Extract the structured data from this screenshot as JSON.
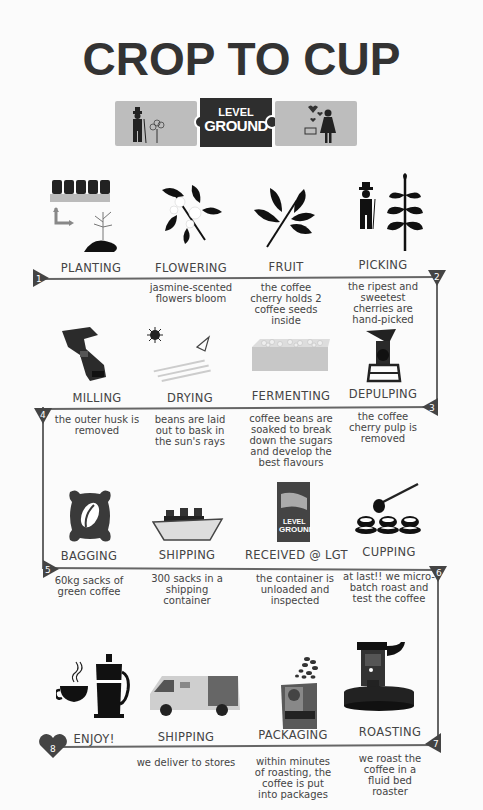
{
  "title": "CROP TO CUP",
  "logo": {
    "line1": "LEVEL",
    "line2": "GROUND"
  },
  "colors": {
    "text": "#333333",
    "line": "#666666",
    "marker": "#444444",
    "logo_side": "#bdbdbd",
    "logo_center": "#2e2e2e"
  },
  "rows": [
    {
      "steps": [
        {
          "label": "PLANTING",
          "desc": "",
          "icon": "seedling-tray-icon"
        },
        {
          "label": "FLOWERING",
          "desc": "jasmine-scented flowers bloom",
          "icon": "flower-branch-icon"
        },
        {
          "label": "FRUIT",
          "desc": "the coffee cherry holds 2 coffee seeds inside",
          "icon": "coffee-branch-icon"
        },
        {
          "label": "PICKING",
          "desc": "the ripest and sweetest cherries are hand-picked",
          "icon": "farmer-with-plant-icon"
        }
      ]
    },
    {
      "steps": [
        {
          "label": "MILLING",
          "desc": "the outer husk is removed",
          "icon": "milling-machine-icon"
        },
        {
          "label": "DRYING",
          "desc": "beans are laid out to bask in the sun's rays",
          "icon": "sun-drying-icon"
        },
        {
          "label": "FERMENTING",
          "desc": "coffee beans are soaked to break down the sugars and develop the best flavours",
          "icon": "fermenting-tank-icon"
        },
        {
          "label": "DEPULPING",
          "desc": "the coffee cherry pulp is removed",
          "icon": "depulper-machine-icon"
        }
      ]
    },
    {
      "steps": [
        {
          "label": "BAGGING",
          "desc": "60kg sacks of green coffee",
          "icon": "coffee-sack-icon"
        },
        {
          "label": "SHIPPING",
          "desc": "300 sacks in a shipping container",
          "icon": "cargo-ship-icon"
        },
        {
          "label": "RECEIVED @ LGT",
          "desc": "the container is unloaded and inspected",
          "icon": "level-ground-bag-icon"
        },
        {
          "label": "CUPPING",
          "desc": "at last!! we micro-batch roast and test the coffee",
          "icon": "cupping-spoon-icon"
        }
      ]
    },
    {
      "steps": [
        {
          "label": "ENJOY!",
          "desc": "",
          "icon": "french-press-cup-icon"
        },
        {
          "label": "SHIPPING",
          "desc": "we deliver to stores",
          "icon": "delivery-van-icon"
        },
        {
          "label": "PACKAGING",
          "desc": "within minutes of roasting, the coffee is put into packages",
          "icon": "coffee-package-icon"
        },
        {
          "label": "ROASTING",
          "desc": "we roast the coffee in a fluid bed roaster",
          "icon": "fluid-bed-roaster-icon"
        }
      ]
    }
  ],
  "markers": [
    "1",
    "2",
    "3",
    "4",
    "5",
    "6",
    "7",
    "8"
  ]
}
